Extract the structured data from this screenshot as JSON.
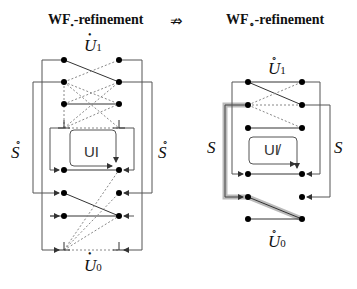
{
  "left": {
    "title_prefix": "WF",
    "title_sub": "•",
    "title_suffix": "-refinement",
    "top_label": "U",
    "top_sub": "1",
    "top_accent": "•",
    "bottom_label": "U",
    "bottom_sub": "0",
    "bottom_accent": "•",
    "side_left": "S",
    "side_left_accent": "∘",
    "side_right": "S",
    "side_right_accent": "∘",
    "box_label": "UI"
  },
  "connector": {
    "symbol": "⇏"
  },
  "right": {
    "title_prefix": "WF",
    "title_sub": "∘",
    "title_suffix": "-refinement",
    "top_label": "U",
    "top_sub": "1",
    "top_accent": "∘",
    "bottom_label": "U",
    "bottom_sub": "0",
    "bottom_accent": "∘",
    "side_left": "S",
    "side_right": "S",
    "box_label": "UI̸"
  },
  "colors": {
    "line": "#444444",
    "dot": "#000000",
    "highlight": "#aaaaaa"
  }
}
